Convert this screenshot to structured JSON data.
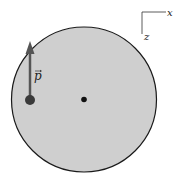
{
  "diagram": {
    "disk": {
      "fill": "#cfcfcf",
      "stroke": "#1a1a1a"
    },
    "center_dot": {
      "color": "#111111"
    },
    "particle": {
      "color": "#3a3a3a"
    },
    "momentum_vector": {
      "label": "p",
      "has_arrow_accent": true,
      "color": "#555555",
      "direction": "up"
    },
    "axes": {
      "x_label": "x",
      "z_label": "z"
    }
  }
}
